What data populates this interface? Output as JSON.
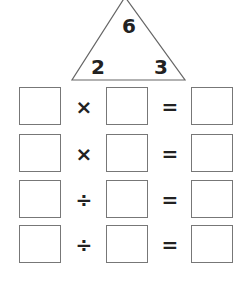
{
  "triangle": {
    "top": "6",
    "bottom_left": "2",
    "bottom_right": "3"
  },
  "equations": [
    {
      "left": "",
      "operator": "×",
      "right": "",
      "equals": "=",
      "result": ""
    },
    {
      "left": "",
      "operator": "×",
      "right": "",
      "equals": "=",
      "result": ""
    },
    {
      "left": "",
      "operator": "÷",
      "right": "",
      "equals": "=",
      "result": ""
    },
    {
      "left": "",
      "operator": "÷",
      "right": "",
      "equals": "=",
      "result": ""
    }
  ]
}
